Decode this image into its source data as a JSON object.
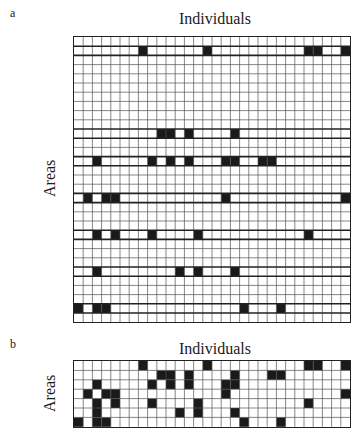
{
  "panel_a": {
    "label": "a",
    "title": "Individuals",
    "ylabel": "Areas",
    "rows": 31,
    "cols": 30,
    "highlight_rows": [
      1,
      10,
      13,
      17,
      21,
      25,
      29
    ],
    "filled": {
      "1": [
        7,
        14,
        25,
        26,
        29
      ],
      "10": [
        9,
        10,
        12,
        17
      ],
      "13": [
        2,
        8,
        10,
        12,
        16,
        17,
        20,
        21
      ],
      "17": [
        1,
        3,
        4,
        16,
        29
      ],
      "21": [
        2,
        4,
        8,
        13,
        25
      ],
      "25": [
        2,
        11,
        13,
        17
      ],
      "29": [
        0,
        2,
        3,
        18,
        22
      ]
    }
  },
  "panel_b": {
    "label": "b",
    "title": "Individuals",
    "ylabel": "Areas",
    "rows": 7,
    "cols": 30,
    "filled": {
      "0": [
        7,
        14,
        25,
        26,
        29
      ],
      "1": [
        9,
        10,
        12,
        17,
        21,
        22
      ],
      "2": [
        2,
        8,
        10,
        12,
        16,
        17
      ],
      "3": [
        1,
        3,
        4,
        16,
        29
      ],
      "4": [
        2,
        4,
        8,
        13,
        25
      ],
      "5": [
        2,
        11,
        13,
        17
      ],
      "6": [
        0,
        2,
        3,
        18,
        22
      ]
    }
  },
  "colors": {
    "fill": "#1a1a1a",
    "grid_line": "#555555",
    "border": "#222222",
    "background": "#ffffff"
  }
}
